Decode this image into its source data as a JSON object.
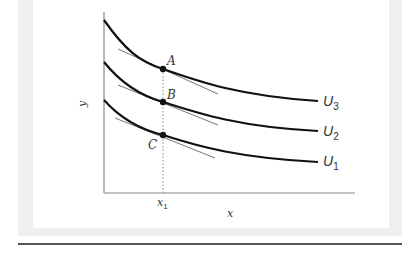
{
  "diagram": {
    "type": "indifference-curves",
    "axes": {
      "x_label": "x",
      "y_label": "y",
      "x_tick_label": "x",
      "x_tick_subscript": "1"
    },
    "points": [
      {
        "label": "A",
        "curve": "U3"
      },
      {
        "label": "B",
        "curve": "U2"
      },
      {
        "label": "C",
        "curve": "U1"
      }
    ],
    "curves": [
      {
        "name": "U3",
        "letter": "U",
        "subscript": "3"
      },
      {
        "name": "U2",
        "letter": "U",
        "subscript": "2"
      },
      {
        "name": "U1",
        "letter": "U",
        "subscript": "1"
      }
    ],
    "colors": {
      "curve": "#111111",
      "axis": "#888888",
      "tangent": "#666666",
      "frame": "#efefef",
      "rule": "#555555"
    }
  }
}
